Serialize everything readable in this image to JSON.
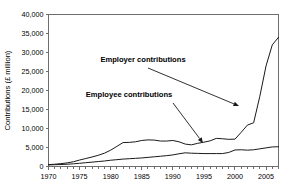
{
  "chart_data": {
    "type": "line",
    "title": "",
    "xlabel": "",
    "ylabel": "Contributions (£ million)",
    "xlim": [
      1970,
      2007
    ],
    "ylim": [
      0,
      40000
    ],
    "grid": false,
    "legend_position": "none",
    "x_tick_labels": [
      "1970",
      "1975",
      "1980",
      "1985",
      "1990",
      "1995",
      "2000",
      "2005"
    ],
    "x_tick_values": [
      1970,
      1975,
      1980,
      1985,
      1990,
      1995,
      2000,
      2005
    ],
    "y_tick_labels": [
      "0",
      "5,000",
      "10,000",
      "15,000",
      "20,000",
      "25,000",
      "30,000",
      "35,000",
      "40,000"
    ],
    "y_tick_values": [
      0,
      5000,
      10000,
      15000,
      20000,
      25000,
      30000,
      35000,
      40000
    ],
    "x": [
      1970,
      1971,
      1972,
      1973,
      1974,
      1975,
      1976,
      1977,
      1978,
      1979,
      1980,
      1981,
      1982,
      1983,
      1984,
      1985,
      1986,
      1987,
      1988,
      1989,
      1990,
      1991,
      1992,
      1993,
      1994,
      1995,
      1996,
      1997,
      1998,
      1999,
      2000,
      2001,
      2002,
      2003,
      2004,
      2005,
      2006,
      2007
    ],
    "series": [
      {
        "name": "Employer contributions",
        "values": [
          500,
          600,
          750,
          950,
          1250,
          1700,
          2100,
          2500,
          2950,
          3500,
          4300,
          5300,
          6300,
          6350,
          6500,
          6850,
          7000,
          6950,
          6700,
          6700,
          6850,
          6500,
          5900,
          5700,
          6100,
          6400,
          6750,
          7400,
          7300,
          7150,
          7200,
          9000,
          10900,
          11500,
          18500,
          26500,
          32000,
          34000
        ]
      },
      {
        "name": "Employee contributions",
        "values": [
          420,
          470,
          520,
          600,
          700,
          850,
          1000,
          1150,
          1300,
          1450,
          1650,
          1800,
          1950,
          2050,
          2150,
          2250,
          2400,
          2550,
          2700,
          2850,
          3050,
          3350,
          3600,
          3500,
          3450,
          3400,
          3400,
          3400,
          3400,
          3700,
          4350,
          4400,
          4300,
          4400,
          4650,
          4900,
          5150,
          5200
        ]
      }
    ],
    "annotations": [
      {
        "text": "Employer contributions",
        "label_x": 143,
        "label_y": 62,
        "leader_from_x": 148,
        "leader_from_y": 68,
        "leader_to_x": 239,
        "leader_to_y": 106
      },
      {
        "text": "Employee contributions",
        "label_x": 129,
        "label_y": 97,
        "leader_from_x": 173,
        "leader_from_y": 103,
        "leader_to_x": 203,
        "leader_to_y": 143
      }
    ],
    "colors": {
      "line": "#1a1a1a",
      "frame": "#6d6d6d",
      "background": "#ffffff",
      "text": "#000000"
    }
  }
}
